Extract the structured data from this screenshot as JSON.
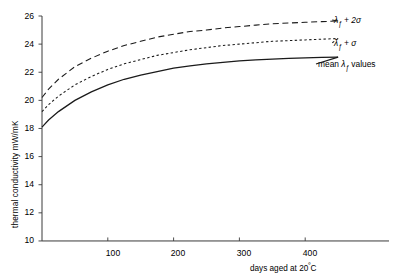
{
  "chart_data": {
    "type": "line",
    "title": "",
    "xlabel": "days aged at 20ºC",
    "ylabel": "thermal conductivity  mW/mK",
    "xlim": [
      0,
      460
    ],
    "ylim": [
      10,
      26
    ],
    "xticks": [
      100,
      200,
      300,
      400
    ],
    "yticks": [
      10,
      12,
      14,
      16,
      18,
      20,
      22,
      24,
      26
    ],
    "grid": false,
    "legend_position": "right-inline-at-curve-ends",
    "series": [
      {
        "name": "λƒ + 2σ",
        "style": "dashed",
        "color": "#1a1a1a",
        "x": [
          0,
          10,
          25,
          50,
          75,
          100,
          125,
          150,
          175,
          200,
          225,
          250,
          275,
          300,
          325,
          350,
          375,
          400,
          425,
          450
        ],
        "y": [
          20.2,
          20.8,
          21.5,
          22.4,
          23.0,
          23.5,
          23.9,
          24.2,
          24.5,
          24.7,
          24.9,
          25.0,
          25.15,
          25.25,
          25.35,
          25.45,
          25.5,
          25.55,
          25.6,
          25.65
        ]
      },
      {
        "name": "λƒ + σ",
        "style": "dotted",
        "color": "#1a1a1a",
        "x": [
          0,
          10,
          25,
          50,
          75,
          100,
          125,
          150,
          175,
          200,
          225,
          250,
          275,
          300,
          325,
          350,
          375,
          400,
          425,
          450
        ],
        "y": [
          19.2,
          19.7,
          20.3,
          21.1,
          21.7,
          22.2,
          22.6,
          22.9,
          23.2,
          23.4,
          23.6,
          23.75,
          23.9,
          24.0,
          24.1,
          24.2,
          24.25,
          24.3,
          24.35,
          24.4
        ]
      },
      {
        "name": "mean λƒ values",
        "style": "solid",
        "color": "#1a1a1a",
        "x": [
          0,
          10,
          25,
          50,
          75,
          100,
          125,
          150,
          175,
          200,
          225,
          250,
          275,
          300,
          325,
          350,
          375,
          400,
          425,
          450
        ],
        "y": [
          18.1,
          18.6,
          19.2,
          20.0,
          20.6,
          21.1,
          21.5,
          21.8,
          22.05,
          22.3,
          22.45,
          22.6,
          22.7,
          22.8,
          22.88,
          22.94,
          22.99,
          23.03,
          23.06,
          23.08
        ]
      }
    ]
  },
  "axis": {
    "ylabel_text": "thermal conductivity  mW/mK",
    "xlabel_prefix": "days aged at 20",
    "xlabel_degree": "º",
    "xlabel_suffix": "C"
  },
  "legend": {
    "entries": [
      {
        "label_lambda": "λ",
        "label_sub": "ƒ",
        "label_rest": " + 2σ",
        "style": "dashed"
      },
      {
        "label_lambda": "λ",
        "label_sub": "ƒ",
        "label_rest": " + σ",
        "style": "dotted"
      },
      {
        "label_pre": "mean ",
        "label_lambda": "λ",
        "label_sub": "ƒ",
        "label_rest": " values",
        "style": "solid"
      }
    ],
    "entry1_full": "λƒ + 2σ",
    "entry2_full": "λƒ + σ",
    "entry3_full": "mean λƒ values"
  },
  "colors": {
    "axis": "#3a3a3a",
    "curve": "#1a1a1a",
    "text": "#000000"
  }
}
